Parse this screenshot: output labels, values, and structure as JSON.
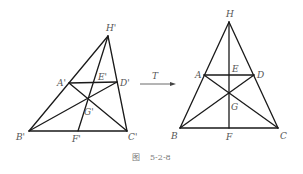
{
  "caption": {
    "fig": "图",
    "number": "5-2-8"
  },
  "transform": {
    "label": "T"
  },
  "left_figure": {
    "points": {
      "H": {
        "label": "H'",
        "x": 108,
        "y": 36
      },
      "A": {
        "label": "A'",
        "x": 69,
        "y": 83
      },
      "E": {
        "label": "E'",
        "x": 96,
        "y": 83
      },
      "D": {
        "label": "D'",
        "x": 117,
        "y": 82
      },
      "G": {
        "label": "G'",
        "x": 88,
        "y": 98
      },
      "B": {
        "label": "B'",
        "x": 29,
        "y": 131
      },
      "F": {
        "label": "F'",
        "x": 78,
        "y": 131
      },
      "C": {
        "label": "C'",
        "x": 127,
        "y": 131
      }
    }
  },
  "right_figure": {
    "points": {
      "H": {
        "label": "H",
        "x": 229,
        "y": 22
      },
      "A": {
        "label": "A",
        "x": 204,
        "y": 75
      },
      "E": {
        "label": "E",
        "x": 229,
        "y": 75
      },
      "D": {
        "label": "D",
        "x": 254,
        "y": 75
      },
      "G": {
        "label": "G",
        "x": 229,
        "y": 92
      },
      "B": {
        "label": "B",
        "x": 180,
        "y": 128
      },
      "F": {
        "label": "F",
        "x": 229,
        "y": 128
      },
      "C": {
        "label": "C",
        "x": 278,
        "y": 128
      }
    }
  }
}
